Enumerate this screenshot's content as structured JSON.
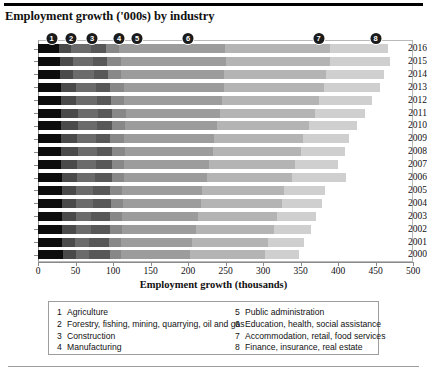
{
  "title": "Employment growth ('000s) by industry",
  "chart_data": {
    "type": "bar",
    "orientation": "horizontal",
    "stacked": true,
    "title": "Employment growth ('000s) by industry",
    "xlabel": "Employment growth (thousands)",
    "ylabel": "",
    "xlim": [
      0,
      500
    ],
    "xticks": [
      0,
      50,
      100,
      150,
      200,
      250,
      300,
      350,
      400,
      450,
      500
    ],
    "xticklabels": [
      "0",
      "50",
      "100",
      "150",
      "200",
      "250",
      "300",
      "350",
      "400",
      "450",
      "500"
    ],
    "grid": false,
    "legend_position": "below-plot",
    "categories": [
      "2016",
      "2015",
      "2014",
      "2013",
      "2012",
      "2011",
      "2010",
      "2009",
      "2008",
      "2007",
      "2006",
      "2005",
      "2004",
      "2003",
      "2002",
      "2001",
      "2000"
    ],
    "series": [
      {
        "name": "Agriculture",
        "key": "1",
        "color": "#0d0d0d",
        "values": [
          28,
          29,
          29,
          30,
          30,
          31,
          31,
          31,
          31,
          31,
          32,
          32,
          32,
          32,
          32,
          32,
          33
        ]
      },
      {
        "name": "Forestry, fishing, mining, quarrying, oil and gas",
        "key": "2",
        "color": "#4a4a4a",
        "values": [
          16,
          17,
          18,
          20,
          21,
          22,
          22,
          21,
          22,
          21,
          20,
          19,
          19,
          18,
          18,
          17,
          17
        ]
      },
      {
        "name": "Construction",
        "key": "3",
        "color": "#6b6b6b",
        "values": [
          27,
          27,
          27,
          27,
          27,
          27,
          26,
          25,
          26,
          25,
          24,
          22,
          22,
          21,
          20,
          19,
          18
        ]
      },
      {
        "name": "Manufacturing",
        "key": "4",
        "color": "#585858",
        "values": [
          19,
          19,
          19,
          19,
          19,
          19,
          19,
          19,
          20,
          21,
          22,
          23,
          24,
          25,
          26,
          27,
          28
        ]
      },
      {
        "name": "Public administration",
        "key": "5",
        "color": "#888888",
        "values": [
          18,
          18,
          18,
          18,
          18,
          18,
          18,
          18,
          17,
          17,
          17,
          16,
          16,
          16,
          16,
          15,
          15
        ]
      },
      {
        "name": "Education, health, social assistance",
        "key": "6",
        "color": "#9c9c9c",
        "values": [
          141,
          140,
          137,
          134,
          130,
          126,
          123,
          120,
          117,
          113,
          110,
          106,
          104,
          101,
          98,
          95,
          92
        ]
      },
      {
        "name": "Accommodation, retail, food services",
        "key": "7",
        "color": "#b4b4b4",
        "values": [
          140,
          139,
          136,
          133,
          129,
          126,
          122,
          119,
          117,
          115,
          113,
          110,
          108,
          106,
          104,
          101,
          99
        ]
      },
      {
        "name": "Finance, insurance, real estate",
        "key": "8",
        "color": "#cfcfcf",
        "values": [
          78,
          80,
          77,
          75,
          71,
          67,
          64,
          61,
          59,
          57,
          73,
          55,
          54,
          52,
          50,
          48,
          46
        ]
      }
    ],
    "totals": [
      467,
      469,
      461,
      456,
      445,
      436,
      425,
      414,
      409,
      400,
      411,
      383,
      379,
      371,
      364,
      354,
      348
    ]
  },
  "legend": {
    "left_column": [
      {
        "num": "1",
        "label": "Agriculture"
      },
      {
        "num": "2",
        "label": "Forestry, fishing, mining, quarrying, oil and gas"
      },
      {
        "num": "3",
        "label": "Construction"
      },
      {
        "num": "4",
        "label": "Manufacturing"
      }
    ],
    "right_column": [
      {
        "num": "5",
        "label": "Public administration"
      },
      {
        "num": "6",
        "label": "Education, health, social assistance"
      },
      {
        "num": "7",
        "label": "Accommodation, retail, food services"
      },
      {
        "num": "8",
        "label": "Finance, insurance, real estate"
      }
    ]
  },
  "callouts": [
    {
      "num": "1",
      "value": 18
    },
    {
      "num": "2",
      "value": 44
    },
    {
      "num": "3",
      "value": 72
    },
    {
      "num": "4",
      "value": 108
    },
    {
      "num": "5",
      "value": 132
    },
    {
      "num": "6",
      "value": 200
    },
    {
      "num": "7",
      "value": 374
    },
    {
      "num": "8",
      "value": 450
    }
  ]
}
